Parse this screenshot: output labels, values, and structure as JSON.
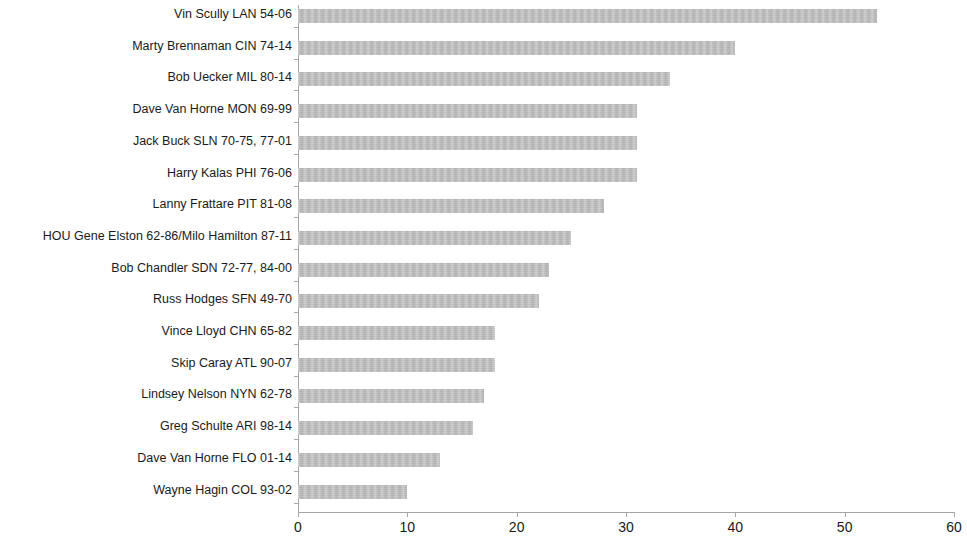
{
  "chart_data": {
    "type": "bar",
    "orientation": "horizontal",
    "title": "",
    "xlabel": "",
    "ylabel": "",
    "xlim": [
      0,
      60
    ],
    "xticks": [
      0,
      10,
      20,
      30,
      40,
      50,
      60
    ],
    "grid": false,
    "legend": null,
    "bar_color": "#b9b9b9",
    "categories": [
      "Vin Scully LAN 54-06",
      "Marty Brennaman CIN 74-14",
      "Bob Uecker MIL 80-14",
      "Dave Van Horne MON 69-99",
      "Jack Buck SLN 70-75,  77-01",
      "Harry Kalas PHI 76-06",
      "Lanny Frattare PIT 81-08",
      "HOU Gene Elston 62-86/Milo Hamilton 87-11",
      "Bob Chandler SDN 72-77, 84-00",
      "Russ Hodges SFN 49-70",
      "Vince Lloyd CHN 65-82",
      "Skip Caray ATL 90-07",
      "Lindsey Nelson NYN 62-78",
      "Greg Schulte ARI 98-14",
      "Dave Van Horne FLO 01-14",
      "Wayne Hagin COL 93-02"
    ],
    "values": [
      53,
      40,
      34,
      31,
      31,
      31,
      28,
      25,
      23,
      22,
      18,
      18,
      17,
      16,
      13,
      10
    ]
  }
}
